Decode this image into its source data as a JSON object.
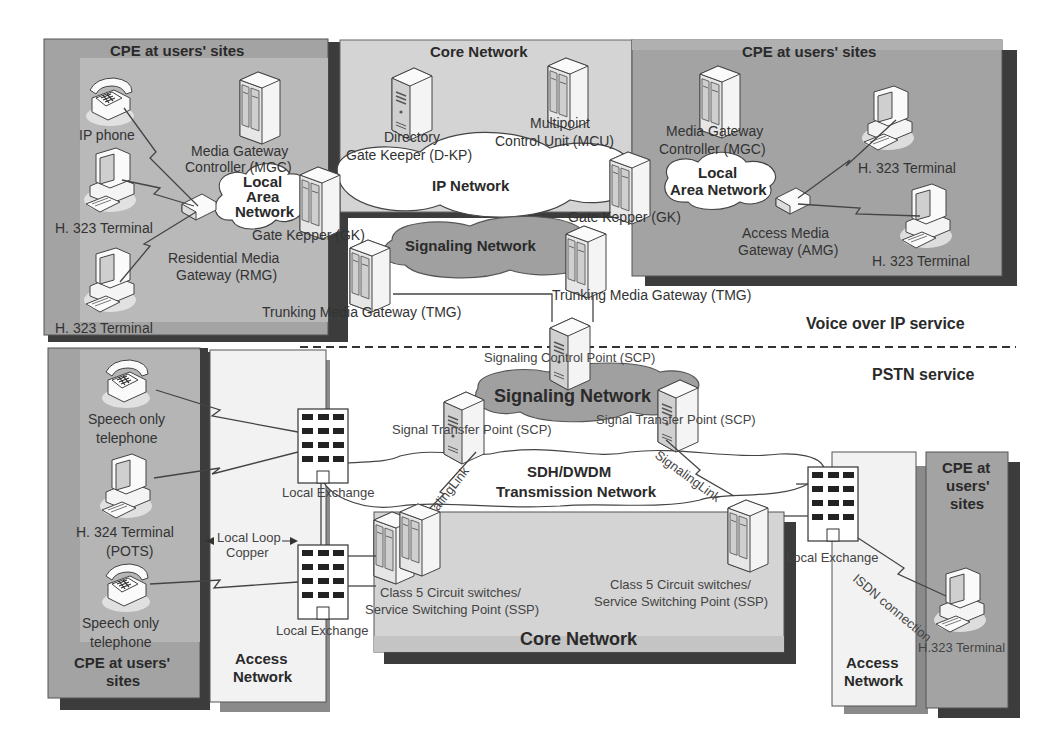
{
  "sections": {
    "voip": "Voice over IP service",
    "pstn": "PSTN service"
  },
  "voip": {
    "cpe_left": {
      "title": "CPE at users' sites",
      "ip_phone": "IP phone",
      "terminal_1": "H. 323 Terminal",
      "terminal_2": "H. 323 Terminal",
      "mgc_1": "Media Gateway",
      "mgc_2": "Controller (MGC)",
      "lan_1": "Local",
      "lan_2": "Area",
      "lan_3": "Network",
      "rmg_1": "Residential Media",
      "rmg_2": "Gateway (RMG)",
      "gk": "Gate Kepper (GK)"
    },
    "core": {
      "title": "Core Network",
      "dkp_1": "Directory",
      "dkp_2": "Gate Keeper (D-KP)",
      "mcu_1": "Multipoint",
      "mcu_2": "Control Unit (MCU)",
      "ip_network": "IP Network",
      "signaling_network": "Signaling Network",
      "tmg_left": "Trunking Media Gateway (TMG)",
      "tmg_right": "Trunking Media Gateway (TMG)"
    },
    "cpe_right": {
      "title": "CPE at users' sites",
      "mgc_1": "Media Gateway",
      "mgc_2": "Controller (MGC)",
      "lan_1": "Local",
      "lan_2": "Area Network",
      "gk": "Gate Kepper (GK)",
      "amg_1": "Access Media",
      "amg_2": "Gateway (AMG)",
      "terminal_1": "H. 323 Terminal",
      "terminal_2": "H. 323 Terminal"
    }
  },
  "pstn": {
    "scp": "Signaling Control Point (SCP)",
    "signaling_network": "Signaling Network",
    "stp_left": "Signal Transfer Point (SCP)",
    "stp_right": "Signal Transfer Point (SCP)",
    "signaling_link_left": "SignalingLink",
    "signaling_link_right": "SignalingLink",
    "transmission_1": "SDH/DWDM",
    "transmission_2": "Transmission Network",
    "cpe_left": {
      "title_1": "CPE at users'",
      "title_2": "sites",
      "phone_1a": "Speech only",
      "phone_1b": "telephone",
      "h324_1": "H. 324 Terminal",
      "h324_2": "(POTS)",
      "phone_2a": "Speech only",
      "phone_2b": "telephone"
    },
    "access_left": {
      "title_1": "Access",
      "title_2": "Network",
      "local_loop_1": "Local Loop",
      "local_loop_2": "Copper",
      "exchange_1": "Local Exchange",
      "exchange_2": "Local Exchange"
    },
    "core": {
      "title": "Core Network",
      "ssp_left_1": "Class 5 Circuit switches/",
      "ssp_left_2": "Service Switching Point (SSP)",
      "ssp_right_1": "Class 5 Circuit switches/",
      "ssp_right_2": "Service Switching Point (SSP)"
    },
    "access_right": {
      "title_1": "Access",
      "title_2": "Network",
      "exchange": "Local Exchange",
      "isdn": "ISDN connection"
    },
    "cpe_right": {
      "title_1": "CPE at",
      "title_2": "users'",
      "title_3": "sites",
      "terminal": "H.323 Terminal"
    }
  },
  "colors": {
    "cpe_fill": "#a9a9a9",
    "cpe_inner": "#b8b8b8",
    "core_fill": "#d4d4d4",
    "access_fill": "#f2f2f2",
    "shadow": "#3c3c3c",
    "signaling_cloud": "#a0a0a0",
    "ip_cloud": "#ffffff"
  }
}
